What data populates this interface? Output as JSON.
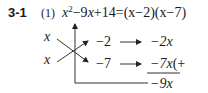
{
  "problem": {
    "number": "3-1",
    "part": "(1)",
    "equation": {
      "lhs_var": "x",
      "exponent": "2",
      "lhs_rest": "−9",
      "lhs_var2": "x",
      "lhs_const": "+14=",
      "rhs": "(x−2)(x−7)"
    }
  },
  "cross_method": {
    "left": [
      "x",
      "x"
    ],
    "constants": [
      "−2",
      "−7"
    ],
    "products": [
      "−2x",
      "−7x"
    ],
    "trailing": "(+",
    "sum": "−9x"
  }
}
